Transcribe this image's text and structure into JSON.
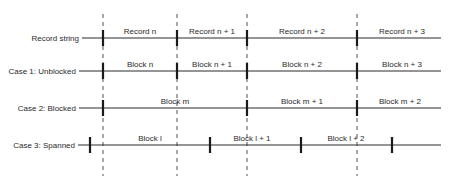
{
  "diagram": {
    "type": "record-blocking-comparison",
    "boundaries_x": [
      103,
      177,
      247,
      357
    ],
    "dash_top": 14,
    "dash_bottom": 176,
    "line_end_x": 441,
    "rows": [
      {
        "id": "record-string",
        "label": "Record string",
        "y": 38,
        "line_start_x": 82,
        "ticks_x": [
          103,
          177,
          247,
          357
        ],
        "segments": [
          {
            "label": "Record n",
            "x": 140
          },
          {
            "label": "Record n + 1",
            "x": 212
          },
          {
            "label": "Record n + 2",
            "x": 302
          },
          {
            "label": "Record n + 3",
            "x": 402
          }
        ]
      },
      {
        "id": "case-1-unblocked",
        "label": "Case 1: Unblocked",
        "y": 71,
        "line_start_x": 79,
        "ticks_x": [
          103,
          177,
          247,
          357
        ],
        "segments": [
          {
            "label": "Block n",
            "x": 140
          },
          {
            "label": "Block n + 1",
            "x": 212
          },
          {
            "label": "Block n + 2",
            "x": 302
          },
          {
            "label": "Block n + 3",
            "x": 402
          }
        ]
      },
      {
        "id": "case-2-blocked",
        "label": "Case 2: Blocked",
        "y": 108,
        "line_start_x": 79,
        "ticks_x": [
          103,
          247,
          357
        ],
        "segments": [
          {
            "label": "Block m",
            "x": 175
          },
          {
            "label": "Block m + 1",
            "x": 302
          },
          {
            "label": "Block m + 2",
            "x": 400
          }
        ]
      },
      {
        "id": "case-3-spanned",
        "label": "Case 3: Spanned",
        "y": 145,
        "line_start_x": 78,
        "ticks_x": [
          90,
          210,
          301,
          392
        ],
        "segments": [
          {
            "label": "Block l",
            "x": 150
          },
          {
            "label": "Block l + 1",
            "x": 252
          },
          {
            "label": "Block l + 2",
            "x": 346
          }
        ]
      }
    ],
    "colors": {
      "line": "#2a2a2a",
      "tick": "#1a1a1a",
      "dash": "#3a3a3a",
      "text": "#2a2a2a"
    }
  }
}
